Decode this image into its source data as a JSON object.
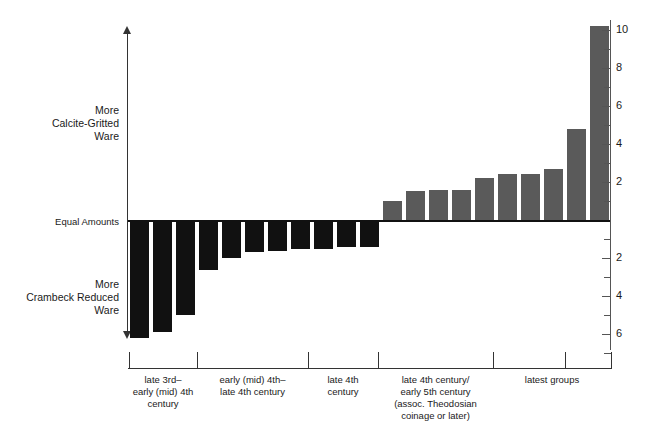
{
  "chart_data": {
    "type": "bar",
    "title": "",
    "subtitle": "",
    "xlabel": "",
    "ylabel": "Ratio of Calcite-Gritted Ware to Crambeck Reduced Ware",
    "ylim": [
      -7,
      10.5
    ],
    "grid": false,
    "legend": null,
    "axis_annotations": {
      "upper": "More\nCalcite-Gritted\nWare",
      "zero": "Equal Amounts",
      "lower": "More\nCrambeck Reduced\nWare"
    },
    "y_ticks_major": [
      10,
      8,
      6,
      4,
      2,
      -2,
      -4,
      -6
    ],
    "y_tick_labels": [
      "10",
      "8",
      "6",
      "4",
      "2",
      "2",
      "4",
      "6"
    ],
    "y_ticks_minor": [
      9,
      7,
      5,
      3,
      1,
      -1,
      -3,
      -5,
      -7
    ],
    "values": [
      -6.2,
      -5.9,
      -5.0,
      -2.6,
      -2.0,
      -1.7,
      -1.6,
      -1.5,
      -1.5,
      -1.4,
      -1.4,
      1.0,
      1.5,
      1.6,
      1.6,
      2.2,
      2.4,
      2.4,
      2.7,
      4.8,
      10.2
    ],
    "bar_colors": {
      "negative": "#111111",
      "positive": "#5a5a5a"
    },
    "groups": [
      {
        "label": "late 3rd–\nearly (mid) 4th\ncentury",
        "bar_start": 0,
        "bar_end": 2
      },
      {
        "label": "early (mid) 4th–\nlate 4th century",
        "bar_start": 3,
        "bar_end": 7
      },
      {
        "label": "late 4th\ncentury",
        "bar_start": 8,
        "bar_end": 10
      },
      {
        "label": "late 4th century/\nearly 5th century\n(assoc. Theodosian\ncoinage or later)",
        "bar_start": 11,
        "bar_end": 15
      },
      {
        "label": "latest groups",
        "bar_start": 16,
        "bar_end": 20
      }
    ],
    "group_boundaries_px": [
      129,
      197,
      308,
      378,
      493,
      565,
      611
    ]
  }
}
